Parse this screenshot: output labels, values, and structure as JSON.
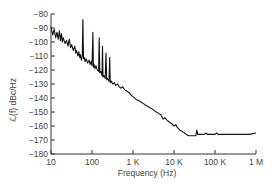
{
  "chart_data": {
    "type": "line",
    "title": "",
    "xlabel": "Frequency (Hz)",
    "ylabel": "ℒ(f) dBc/Hz",
    "x_scale": "log",
    "xlim": [
      10,
      1000000
    ],
    "ylim": [
      -180,
      -80
    ],
    "grid": false,
    "legend": null,
    "x_ticks": [
      {
        "value": 10,
        "label": "10"
      },
      {
        "value": 100,
        "label": "100"
      },
      {
        "value": 1000,
        "label": "1 K"
      },
      {
        "value": 10000,
        "label": "10 K"
      },
      {
        "value": 100000,
        "label": "100 K"
      },
      {
        "value": 1000000,
        "label": "1 M"
      }
    ],
    "y_ticks": [
      {
        "value": -80,
        "label": "−80"
      },
      {
        "value": -90,
        "label": "−90"
      },
      {
        "value": -100,
        "label": "−100"
      },
      {
        "value": -110,
        "label": "−110"
      },
      {
        "value": -120,
        "label": "−120"
      },
      {
        "value": -130,
        "label": "−130"
      },
      {
        "value": -140,
        "label": "−140"
      },
      {
        "value": -150,
        "label": "−150"
      },
      {
        "value": -160,
        "label": "−160"
      },
      {
        "value": -170,
        "label": "−170"
      },
      {
        "value": -180,
        "label": "−180"
      }
    ],
    "series": [
      {
        "name": "Phase noise",
        "color": "#111111",
        "points": [
          [
            10,
            -89
          ],
          [
            11,
            -95
          ],
          [
            12,
            -91
          ],
          [
            13,
            -97
          ],
          [
            14,
            -93
          ],
          [
            15,
            -98
          ],
          [
            16,
            -92
          ],
          [
            17,
            -99
          ],
          [
            18,
            -94
          ],
          [
            19,
            -100
          ],
          [
            20,
            -97
          ],
          [
            22,
            -101
          ],
          [
            24,
            -99
          ],
          [
            26,
            -103
          ],
          [
            28,
            -98
          ],
          [
            30,
            -104
          ],
          [
            32,
            -102
          ],
          [
            35,
            -106
          ],
          [
            38,
            -103
          ],
          [
            40,
            -108
          ],
          [
            42,
            -106
          ],
          [
            45,
            -110
          ],
          [
            48,
            -107
          ],
          [
            50,
            -111
          ],
          [
            52,
            -109
          ],
          [
            55,
            -113
          ],
          [
            58,
            -110
          ],
          [
            60,
            -84
          ],
          [
            62,
            -112
          ],
          [
            65,
            -111
          ],
          [
            68,
            -114
          ],
          [
            72,
            -112
          ],
          [
            78,
            -115
          ],
          [
            85,
            -113
          ],
          [
            90,
            -116
          ],
          [
            95,
            -114
          ],
          [
            100,
            -117
          ],
          [
            105,
            -93
          ],
          [
            108,
            -118
          ],
          [
            112,
            -116
          ],
          [
            118,
            -119
          ],
          [
            125,
            -117
          ],
          [
            135,
            -120
          ],
          [
            145,
            -121
          ],
          [
            150,
            -97
          ],
          [
            155,
            -122
          ],
          [
            165,
            -121
          ],
          [
            175,
            -124
          ],
          [
            180,
            -103
          ],
          [
            185,
            -125
          ],
          [
            195,
            -124
          ],
          [
            210,
            -126
          ],
          [
            220,
            -108
          ],
          [
            228,
            -127
          ],
          [
            240,
            -126
          ],
          [
            260,
            -128
          ],
          [
            270,
            -111
          ],
          [
            278,
            -129
          ],
          [
            295,
            -128
          ],
          [
            320,
            -130
          ],
          [
            350,
            -129
          ],
          [
            380,
            -131
          ],
          [
            420,
            -130
          ],
          [
            460,
            -132
          ],
          [
            500,
            -133
          ],
          [
            560,
            -132
          ],
          [
            620,
            -134
          ],
          [
            700,
            -135
          ],
          [
            800,
            -136
          ],
          [
            900,
            -138
          ],
          [
            1000,
            -139
          ],
          [
            1200,
            -141
          ],
          [
            1400,
            -142
          ],
          [
            1600,
            -143
          ],
          [
            1800,
            -144
          ],
          [
            2000,
            -145
          ],
          [
            2300,
            -146
          ],
          [
            2600,
            -147
          ],
          [
            3000,
            -148
          ],
          [
            3300,
            -149
          ],
          [
            3700,
            -150
          ],
          [
            4200,
            -151
          ],
          [
            4800,
            -152
          ],
          [
            5400,
            -155
          ],
          [
            6000,
            -154
          ],
          [
            6800,
            -156
          ],
          [
            7500,
            -157
          ],
          [
            8500,
            -158
          ],
          [
            10000,
            -160
          ],
          [
            11000,
            -159
          ],
          [
            12000,
            -161
          ],
          [
            14000,
            -163
          ],
          [
            16000,
            -164
          ],
          [
            18000,
            -165
          ],
          [
            20000,
            -166
          ],
          [
            23000,
            -167
          ],
          [
            26000,
            -167
          ],
          [
            30000,
            -167
          ],
          [
            34000,
            -167
          ],
          [
            36000,
            -163
          ],
          [
            38000,
            -166
          ],
          [
            45000,
            -166
          ],
          [
            55000,
            -166
          ],
          [
            60000,
            -165
          ],
          [
            65000,
            -166
          ],
          [
            80000,
            -166
          ],
          [
            100000,
            -166
          ],
          [
            110000,
            -165
          ],
          [
            120000,
            -166
          ],
          [
            150000,
            -166
          ],
          [
            200000,
            -166
          ],
          [
            300000,
            -166
          ],
          [
            400000,
            -166
          ],
          [
            500000,
            -166
          ],
          [
            700000,
            -166
          ],
          [
            1000000,
            -165
          ]
        ]
      }
    ]
  },
  "plot_area": {
    "x0_px": 51,
    "x1_px": 256,
    "y_top_px": 14,
    "y_bottom_px": 154
  }
}
